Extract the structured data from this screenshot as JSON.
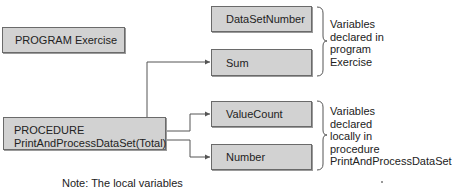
{
  "program": {
    "label": "PROGRAM Exercise"
  },
  "procedure": {
    "line1": "PROCEDURE",
    "line2": "PrintAndProcessDataSet(Total)"
  },
  "program_variables": [
    {
      "label": "DataSetNumber"
    },
    {
      "label": "Sum"
    }
  ],
  "local_variables": [
    {
      "label": "ValueCount"
    },
    {
      "label": "Number"
    }
  ],
  "annotations": {
    "program_scope": [
      "Variables",
      "declared in",
      "program",
      "Exercise"
    ],
    "local_scope": [
      "Variables",
      "declared",
      "locally in",
      "procedure",
      "PrintAndProcessDataSet"
    ]
  },
  "note": "Note: The local variables",
  "colors": {
    "box_fill": "#d2d2d2",
    "box_border": "#6a6a6a",
    "line": "#555555"
  }
}
